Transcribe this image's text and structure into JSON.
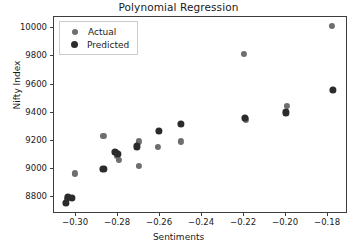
{
  "chart_data": {
    "type": "scatter",
    "title": "Polynomial Regression",
    "xlabel": "Sentiments",
    "ylabel": "Nifty Index",
    "xlim": [
      -0.3105,
      -0.1705
    ],
    "ylim": [
      8680,
      10080
    ],
    "xticks": [
      -0.3,
      -0.28,
      -0.26,
      -0.24,
      -0.22,
      -0.2,
      -0.18
    ],
    "xtick_labels": [
      "−0.30",
      "−0.28",
      "−0.26",
      "−0.24",
      "−0.22",
      "−0.20",
      "−0.18"
    ],
    "yticks": [
      8800,
      9000,
      9200,
      9400,
      9600,
      9800,
      10000
    ],
    "ytick_labels": [
      "8800",
      "9000",
      "9200",
      "9400",
      "9600",
      "9800",
      "10000"
    ],
    "grid": false,
    "legend_position": "upper left",
    "series": [
      {
        "name": "Actual",
        "color": "#6e6e6e",
        "marker": "circle",
        "points": [
          {
            "x": -0.3045,
            "y": 8790
          },
          {
            "x": -0.3005,
            "y": 8968
          },
          {
            "x": -0.287,
            "y": 9237
          },
          {
            "x": -0.281,
            "y": 9118
          },
          {
            "x": -0.2805,
            "y": 9093
          },
          {
            "x": -0.2795,
            "y": 9063
          },
          {
            "x": -0.27,
            "y": 9023
          },
          {
            "x": -0.27,
            "y": 9196
          },
          {
            "x": -0.261,
            "y": 9158
          },
          {
            "x": -0.25,
            "y": 9196
          },
          {
            "x": -0.22,
            "y": 9815
          },
          {
            "x": -0.219,
            "y": 9352
          },
          {
            "x": -0.1995,
            "y": 9448
          },
          {
            "x": -0.178,
            "y": 10018
          }
        ]
      },
      {
        "name": "Predicted",
        "color": "#2b2b2b",
        "marker": "circle",
        "points": [
          {
            "x": -0.305,
            "y": 8760
          },
          {
            "x": -0.304,
            "y": 8800
          },
          {
            "x": -0.302,
            "y": 8797
          },
          {
            "x": -0.287,
            "y": 9003
          },
          {
            "x": -0.2815,
            "y": 9122
          },
          {
            "x": -0.28,
            "y": 9105
          },
          {
            "x": -0.271,
            "y": 9160
          },
          {
            "x": -0.2605,
            "y": 9268
          },
          {
            "x": -0.25,
            "y": 9320
          },
          {
            "x": -0.2195,
            "y": 9362
          },
          {
            "x": -0.2,
            "y": 9402
          },
          {
            "x": -0.1775,
            "y": 9562
          }
        ]
      }
    ]
  },
  "legend": {
    "entries": [
      {
        "label": "Actual"
      },
      {
        "label": "Predicted"
      }
    ]
  }
}
